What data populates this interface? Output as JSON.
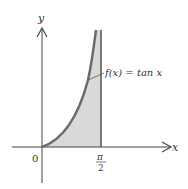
{
  "diagram": {
    "x_axis_label": "x",
    "y_axis_label": "y",
    "origin_label": "0",
    "x_tick_label_numerator": "π",
    "x_tick_label_denominator": "2",
    "function_label": "f(x) = tan x",
    "colors": {
      "curve": "#6a6a6a",
      "fill": "#d9d9d9",
      "axes": "#444444",
      "text": "#333333"
    }
  }
}
